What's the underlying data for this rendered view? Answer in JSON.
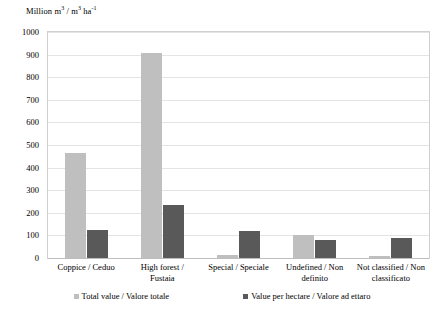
{
  "chart_data": {
    "type": "bar",
    "title": "",
    "subtitle": "",
    "xlabel": "",
    "ylabel": "Million m³ / m³ ha⁻¹",
    "ylabel_parts": {
      "prefix": "Million m",
      "sup1": "3",
      "mid": " / m",
      "sup2": "3",
      "unit": " ha",
      "sup3": "-1"
    },
    "ylim": [
      0,
      1000
    ],
    "ytick_step": 100,
    "yticks": [
      "1000",
      "900",
      "800",
      "700",
      "600",
      "500",
      "400",
      "300",
      "200",
      "100",
      "0"
    ],
    "grid": true,
    "legend_position": "bottom",
    "categories": [
      "Coppice / Ceduo",
      "High forest / Fustaia",
      "Special / Speciale",
      "Undefined / Non definito",
      "Not classified / Non classificato"
    ],
    "category_lines": [
      [
        "Coppice / Ceduo"
      ],
      [
        "High forest /",
        "Fustaia"
      ],
      [
        "Special / Speciale"
      ],
      [
        "Undefined / Non",
        "definito"
      ],
      [
        "Not classified / Non",
        "classificato"
      ]
    ],
    "series": [
      {
        "name": "Total value / Valore totale",
        "color": "#bfbfbf",
        "values": [
          465,
          905,
          15,
          100,
          10
        ]
      },
      {
        "name": "Value per hectare / Valore ad ettaro",
        "color": "#595959",
        "values": [
          125,
          235,
          120,
          80,
          90
        ]
      }
    ]
  },
  "legend": {
    "items": [
      {
        "label": "Total value / Valore totale"
      },
      {
        "label": "Value per hectare / Valore ad ettaro"
      }
    ]
  }
}
